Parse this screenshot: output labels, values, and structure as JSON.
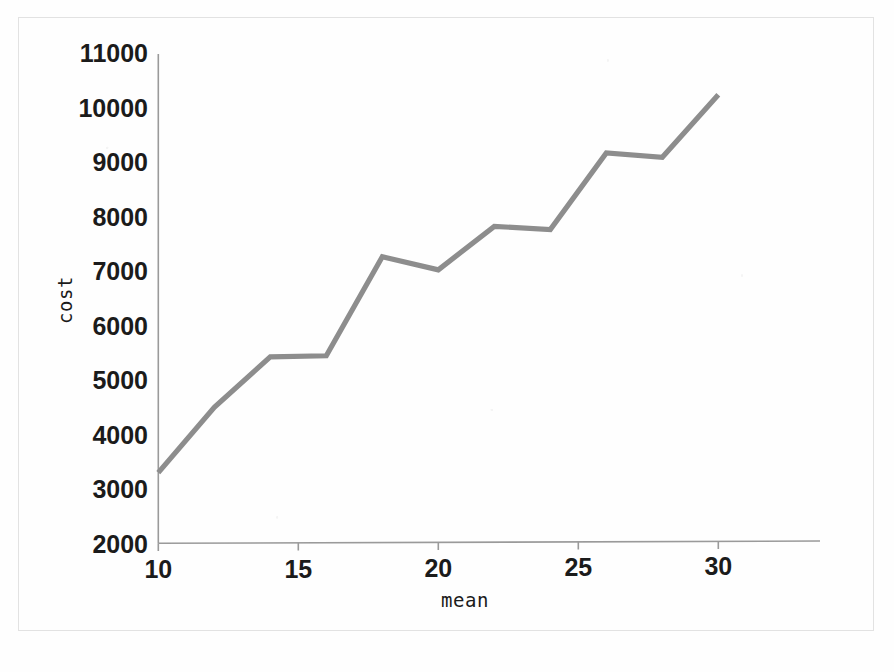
{
  "chart_data": {
    "type": "line",
    "title": "",
    "subtitle": "",
    "xlabel": "mean",
    "ylabel": "cost",
    "x": [
      10,
      12,
      14,
      16,
      18,
      20,
      22,
      24,
      26,
      28,
      30
    ],
    "values": [
      3300,
      4500,
      5430,
      5450,
      7270,
      7030,
      7830,
      7770,
      9180,
      9100,
      10250
    ],
    "series": [
      {
        "name": "cost",
        "color": "#8d8d8d",
        "values": [
          3300,
          4500,
          5430,
          5450,
          7270,
          7030,
          7830,
          7770,
          9180,
          9100,
          10250
        ]
      }
    ],
    "xlim": [
      10,
      33.5
    ],
    "ylim": [
      2000,
      11000
    ],
    "xticks": [
      10,
      15,
      20,
      25,
      30
    ],
    "xtick_labels": [
      "10",
      "15",
      "20",
      "25",
      "30"
    ],
    "yticks": [
      2000,
      3000,
      4000,
      5000,
      6000,
      7000,
      8000,
      9000,
      10000,
      11000
    ],
    "ytick_labels": [
      "2000",
      "3000",
      "4000",
      "5000",
      "6000",
      "7000",
      "8000",
      "9000",
      "10000",
      "11000"
    ],
    "grid": false,
    "legend": "none",
    "line_color": "#8d8d8d",
    "axis_color": "#9a9a9a",
    "background_color": "#fefefe"
  },
  "axes": {
    "x_title": "mean",
    "y_title": "cost"
  }
}
